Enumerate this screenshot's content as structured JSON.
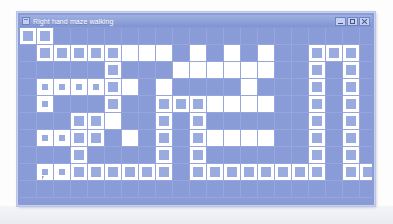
{
  "window": {
    "title": "Right hand maze walking",
    "icon": "maze-window-icon",
    "controls": {
      "minimize_label": "",
      "maximize_label": "",
      "close_label": ""
    }
  },
  "colors": {
    "window_background": "#8a9cd8",
    "grid_line": "#97a7dd",
    "open_cell": "#ffffff",
    "visited_fill": "#9aabdf",
    "title_bar_start": "#9fb0e0",
    "title_bar_end": "#8094d2",
    "page_background": "#ffffff"
  },
  "maze": {
    "columns": 21,
    "rows": 10,
    "cell_size": 17,
    "legend": {
      "0": "empty",
      "1": "open",
      "2": "visited",
      "3": "visited-marked"
    },
    "grid": [
      [
        2,
        2,
        0,
        0,
        0,
        0,
        0,
        0,
        0,
        0,
        0,
        0,
        0,
        0,
        0,
        0,
        0,
        0,
        0,
        0,
        0
      ],
      [
        0,
        2,
        2,
        2,
        2,
        2,
        1,
        1,
        1,
        0,
        1,
        0,
        1,
        0,
        1,
        0,
        0,
        2,
        2,
        2,
        0
      ],
      [
        0,
        0,
        0,
        0,
        0,
        2,
        0,
        0,
        0,
        1,
        1,
        1,
        1,
        1,
        1,
        0,
        0,
        2,
        0,
        2,
        0
      ],
      [
        0,
        3,
        3,
        3,
        3,
        2,
        1,
        0,
        1,
        0,
        0,
        0,
        0,
        1,
        0,
        0,
        0,
        2,
        0,
        2,
        0
      ],
      [
        0,
        3,
        0,
        0,
        0,
        2,
        0,
        0,
        2,
        2,
        2,
        1,
        1,
        1,
        1,
        0,
        0,
        2,
        0,
        2,
        0
      ],
      [
        0,
        0,
        0,
        2,
        2,
        1,
        0,
        0,
        2,
        0,
        2,
        0,
        0,
        0,
        0,
        0,
        0,
        2,
        0,
        2,
        0
      ],
      [
        0,
        3,
        3,
        2,
        2,
        0,
        1,
        0,
        2,
        0,
        2,
        1,
        1,
        1,
        1,
        0,
        0,
        2,
        0,
        2,
        0
      ],
      [
        0,
        0,
        0,
        2,
        0,
        0,
        0,
        0,
        2,
        0,
        2,
        0,
        0,
        0,
        0,
        0,
        0,
        2,
        0,
        2,
        0
      ],
      [
        0,
        3,
        3,
        2,
        2,
        2,
        2,
        2,
        2,
        0,
        2,
        2,
        2,
        2,
        2,
        2,
        2,
        2,
        0,
        2,
        2
      ],
      [
        0,
        0,
        0,
        0,
        0,
        0,
        0,
        0,
        0,
        0,
        0,
        0,
        0,
        0,
        0,
        0,
        0,
        0,
        0,
        0,
        0
      ]
    ]
  },
  "walker": {
    "name": "walker-cursor",
    "column": 1,
    "row": 8
  }
}
